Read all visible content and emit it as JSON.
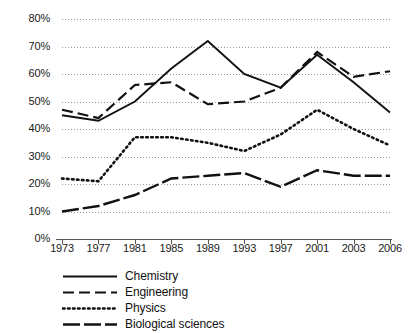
{
  "chart_data": {
    "type": "line",
    "title": "",
    "xlabel": "",
    "ylabel": "",
    "grid": true,
    "legend_position": "bottom-left",
    "ylim": [
      0,
      80
    ],
    "y_ticks": [
      "0%",
      "10%",
      "20%",
      "30%",
      "40%",
      "50%",
      "60%",
      "70%",
      "80%"
    ],
    "y_tick_values": [
      0,
      10,
      20,
      30,
      40,
      50,
      60,
      70,
      80
    ],
    "categories": [
      "1973",
      "1977",
      "1981",
      "1985",
      "1989",
      "1993",
      "1997",
      "2001",
      "2003",
      "2006"
    ],
    "series": [
      {
        "name": "Chemistry",
        "style": "solid",
        "color": "#111111",
        "values": [
          45,
          43,
          50,
          62,
          72,
          60,
          55,
          67,
          57,
          46
        ]
      },
      {
        "name": "Engineering",
        "style": "long-dash",
        "color": "#111111",
        "values": [
          47,
          44,
          56,
          57,
          49,
          50,
          55,
          68,
          59,
          61
        ]
      },
      {
        "name": "Physics",
        "style": "dotted",
        "color": "#111111",
        "values": [
          22,
          21,
          37,
          37,
          35,
          32,
          38,
          47,
          40,
          34
        ]
      },
      {
        "name": "Biological sciences",
        "style": "dash-dot-long",
        "color": "#111111",
        "values": [
          10,
          12,
          16,
          22,
          23,
          24,
          19,
          25,
          23,
          23
        ]
      }
    ]
  },
  "axes": {
    "gridline_color": "#9a9a9a",
    "axis_color": "#555555"
  }
}
